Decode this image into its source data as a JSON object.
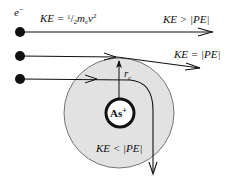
{
  "diagram": {
    "electron_label": "e",
    "electron_sup": "−",
    "ke_formula": {
      "ke": "KE = ",
      "frac": "1",
      "slash": "/",
      "den": "2",
      "m": "m",
      "sub": "e",
      "v": "v",
      "sq": "2"
    },
    "trajectories": [
      {
        "id": "escape",
        "label": "KE > |PE|"
      },
      {
        "id": "critical",
        "label": "KE = |PE|"
      },
      {
        "id": "captured",
        "label": "KE < |PE|"
      }
    ],
    "radius_label": "r",
    "radius_sub": "c",
    "nucleus_label": "As",
    "nucleus_charge": "+",
    "colors": {
      "capture_zone": "#e2e2e2",
      "stroke": "#111111",
      "background": "#ffffff"
    }
  }
}
